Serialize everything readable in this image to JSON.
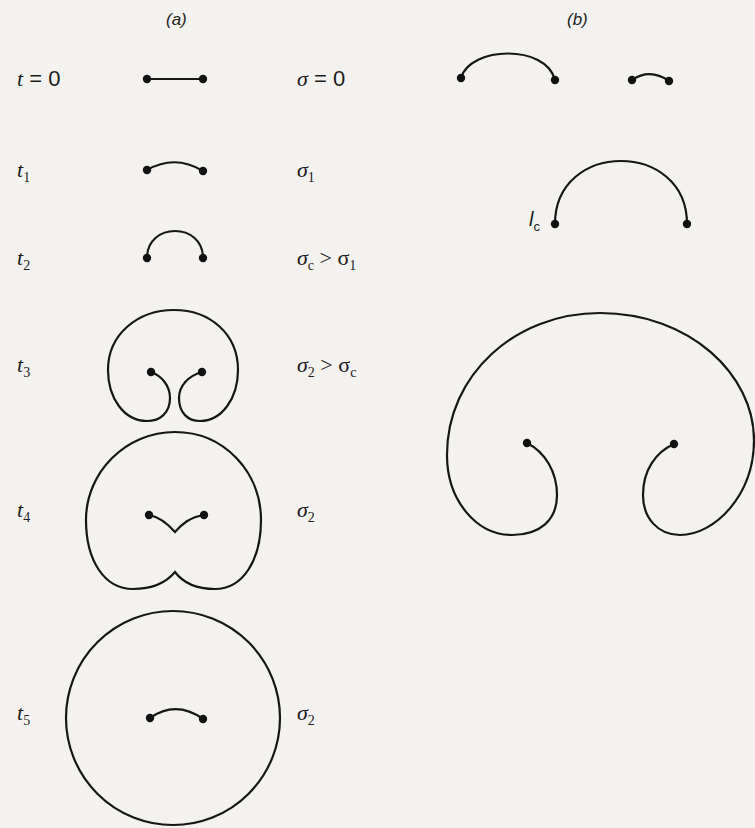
{
  "panels": {
    "a": {
      "label": "(a)"
    },
    "b": {
      "label": "(b)"
    }
  },
  "panel_a_rows": [
    {
      "time": "t",
      "time_sub": "",
      "time_suffix": " = 0",
      "stress": "σ",
      "stress_sub": "",
      "stress_suffix": " = 0",
      "shape": "straight-segment"
    },
    {
      "time": "t",
      "time_sub": "1",
      "time_suffix": "",
      "stress": "σ",
      "stress_sub": "1",
      "stress_suffix": "",
      "shape": "shallow-arc"
    },
    {
      "time": "t",
      "time_sub": "2",
      "time_suffix": "",
      "stress": "σ",
      "stress_sub": "c",
      "stress_suffix": " > σ",
      "stress_suffix_sub": "1",
      "shape": "semicircle"
    },
    {
      "time": "t",
      "time_sub": "3",
      "time_suffix": "",
      "stress": "σ",
      "stress_sub": "2",
      "stress_suffix": " > σ",
      "stress_suffix_sub": "c",
      "shape": "kidney-loop"
    },
    {
      "time": "t",
      "time_sub": "4",
      "time_suffix": "",
      "stress": "σ",
      "stress_sub": "2",
      "stress_suffix": "",
      "shape": "heart-loop-pinched"
    },
    {
      "time": "t",
      "time_sub": "5",
      "time_suffix": "",
      "stress": "σ",
      "stress_sub": "2",
      "stress_suffix": "",
      "shape": "closed-circle-with-new-segment"
    }
  ],
  "panel_b": {
    "critical_length_label": "l",
    "critical_length_sub": "c",
    "shapes": [
      "long-arc",
      "short-arc",
      "critical-semicircle",
      "expanding-loop"
    ]
  },
  "diagram": {
    "stroke_color": "#161616",
    "background_color": "#f3f2ef"
  }
}
